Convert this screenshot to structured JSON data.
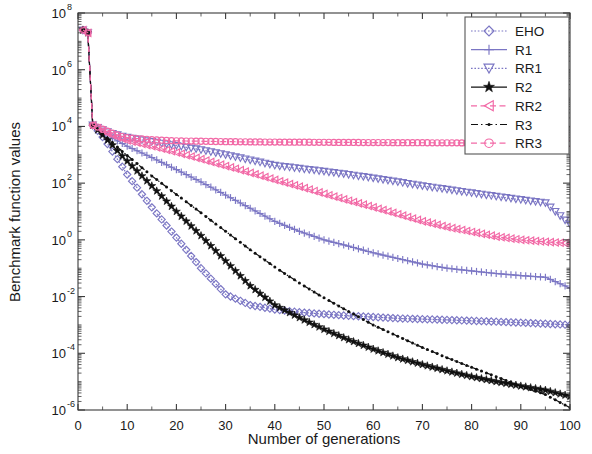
{
  "figure": {
    "background": "#ffffff",
    "frame_color": "#3a3a3a"
  },
  "colors": {
    "blue": "#7B76C4",
    "black": "#101010",
    "pink": "#F269A6"
  },
  "axes": {
    "x_title": "Number of generations",
    "y_title": "Benchmark function values",
    "x_ticks": [
      "0",
      "10",
      "20",
      "30",
      "40",
      "50",
      "60",
      "70",
      "80",
      "90",
      "100"
    ],
    "y_tick_bases": [
      "10",
      "10",
      "10",
      "10",
      "10",
      "10",
      "10",
      "10"
    ],
    "y_tick_exponents": [
      "8",
      "6",
      "4",
      "2",
      "0",
      "-2",
      "-4",
      "-6"
    ]
  },
  "legend": {
    "entries": [
      {
        "label": "EHO",
        "color": "#7B76C4",
        "marker": "diamond",
        "line": "dotted"
      },
      {
        "label": "R1",
        "color": "#7B76C4",
        "marker": "plus",
        "line": "solid"
      },
      {
        "label": "RR1",
        "color": "#7B76C4",
        "marker": "triangle-down",
        "line": "dotted"
      },
      {
        "label": "R2",
        "color": "#101010",
        "marker": "star",
        "line": "solid"
      },
      {
        "label": "RR2",
        "color": "#F269A6",
        "marker": "triangle-left",
        "line": "dashed"
      },
      {
        "label": "R3",
        "color": "#101010",
        "marker": "dot",
        "line": "dashdot"
      },
      {
        "label": "RR3",
        "color": "#F269A6",
        "marker": "circle",
        "line": "dashed"
      }
    ]
  },
  "chart_data": {
    "type": "line",
    "title": "",
    "xlabel": "Number of generations",
    "ylabel": "Benchmark function values",
    "xlim": [
      0,
      100
    ],
    "ylim": [
      1e-06,
      100000000.0
    ],
    "yscale": "log",
    "xscale": "linear",
    "grid": false,
    "legend_position": "top-right",
    "x": [
      1,
      2,
      3,
      4,
      5,
      6,
      7,
      8,
      9,
      10,
      15,
      20,
      25,
      30,
      35,
      40,
      45,
      50,
      55,
      60,
      65,
      70,
      75,
      80,
      85,
      90,
      95,
      100
    ],
    "series": [
      {
        "name": "EHO",
        "color": "#7B76C4",
        "marker": "diamond",
        "values": [
          25000000.0,
          20000000.0,
          11000.0,
          7000.0,
          4200.0,
          2400.0,
          1300.0,
          700.0,
          380.0,
          200.0,
          14.0,
          1.2,
          0.1,
          0.012,
          0.005,
          0.0035,
          0.0028,
          0.0024,
          0.0021,
          0.0019,
          0.0017,
          0.0016,
          0.0015,
          0.0014,
          0.0013,
          0.0012,
          0.0011,
          0.001
        ]
      },
      {
        "name": "R1",
        "color": "#7B76C4",
        "marker": "plus",
        "values": [
          25000000.0,
          20000000.0,
          11000.0,
          8500.0,
          6500.0,
          5000.0,
          3900.0,
          3100.0,
          2500.0,
          2000.0,
          800.0,
          300.0,
          110.0,
          38.0,
          13.0,
          4.5,
          2.0,
          1.0,
          0.6,
          0.35,
          0.22,
          0.14,
          0.1,
          0.08,
          0.065,
          0.055,
          0.048,
          0.02
        ]
      },
      {
        "name": "RR1",
        "color": "#7B76C4",
        "marker": "triangle-down",
        "values": [
          25000000.0,
          20000000.0,
          11000.0,
          9000.0,
          7500.0,
          6400.0,
          5600.0,
          5000.0,
          4500.0,
          4100.0,
          2900.0,
          2100.0,
          1500.0,
          1000.0,
          650.0,
          420.0,
          330.0,
          260.0,
          200.0,
          150.0,
          110.0,
          80.0,
          60.0,
          45.0,
          34.0,
          26.0,
          20.0,
          3.5
        ]
      },
      {
        "name": "R2",
        "color": "#101010",
        "marker": "star",
        "values": [
          25000000.0,
          20000000.0,
          11000.0,
          7500.0,
          5000.0,
          3300.0,
          2200.0,
          1400.0,
          900.0,
          600.0,
          80.0,
          10.0,
          1.4,
          0.18,
          0.024,
          0.005,
          0.0018,
          0.0007,
          0.0003,
          0.00014,
          7e-05,
          4e-05,
          2.4e-05,
          1.5e-05,
          1e-05,
          7e-06,
          5e-06,
          3e-06
        ]
      },
      {
        "name": "RR2",
        "color": "#F269A6",
        "marker": "triangle-left",
        "values": [
          25000000.0,
          20000000.0,
          11000.0,
          8800.0,
          7000.0,
          5800.0,
          4900.0,
          4200.0,
          3700.0,
          3200.0,
          2000.0,
          1200.0,
          700.0,
          400.0,
          230.0,
          130.0,
          75.0,
          42.0,
          24.0,
          14.0,
          8.0,
          4.5,
          2.8,
          1.9,
          1.3,
          1.0,
          0.85,
          0.75
        ]
      },
      {
        "name": "R3",
        "color": "#101010",
        "marker": "dot",
        "values": [
          25000000.0,
          20000000.0,
          11000.0,
          7800.0,
          5400.0,
          3800.0,
          2700.0,
          1900.0,
          1300.0,
          950.0,
          180.0,
          40.0,
          9.0,
          2.0,
          0.45,
          0.11,
          0.03,
          0.009,
          0.003,
          0.001,
          0.0004,
          0.00016,
          7e-05,
          3.2e-05,
          1.5e-05,
          7e-06,
          3.5e-06,
          1.2e-06
        ]
      },
      {
        "name": "RR3",
        "color": "#F269A6",
        "marker": "circle",
        "values": [
          25000000.0,
          20000000.0,
          11000.0,
          9500.0,
          8000.0,
          6800.0,
          5800.0,
          5000.0,
          4400.0,
          4000.0,
          3400.0,
          3100.0,
          3000.0,
          2900.0,
          2850.0,
          2800.0,
          2780.0,
          2750.0,
          2720.0,
          2700.0,
          2680.0,
          2660.0,
          2640.0,
          2620.0,
          2600.0,
          2580.0,
          2560.0,
          2550.0
        ]
      }
    ]
  }
}
